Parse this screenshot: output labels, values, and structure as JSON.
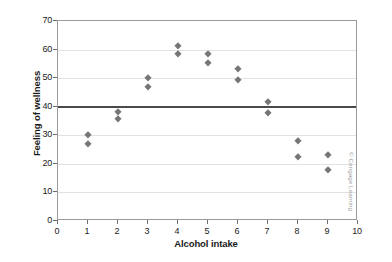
{
  "chart_data": {
    "type": "scatter",
    "title": "",
    "xlabel": "Alcohol intake",
    "ylabel": "Feeling of wellness",
    "xlim": [
      0,
      10
    ],
    "ylim": [
      0,
      70
    ],
    "xticks": [
      0,
      1,
      2,
      3,
      4,
      5,
      6,
      7,
      8,
      9,
      10
    ],
    "yticks": [
      0,
      10,
      20,
      30,
      40,
      50,
      60,
      70
    ],
    "grid": true,
    "legend": "none",
    "marker": "diamond",
    "marker_color": "#767676",
    "grid_color": "#e2e2e2",
    "frame_color": "#9a9a9a",
    "reference_line": {
      "orientation": "horizontal",
      "value": 40,
      "color": "#4a4a4a"
    },
    "x": [
      1,
      1,
      2,
      2,
      3,
      3,
      4,
      4,
      5,
      5,
      6,
      6,
      7,
      7,
      8,
      8,
      9,
      9
    ],
    "y": [
      30,
      27,
      38.3,
      35.7,
      50,
      47,
      61.3,
      58.3,
      58.3,
      55.3,
      53.2,
      49.2,
      41.5,
      37.7,
      28,
      22.3,
      23,
      18
    ],
    "points": [
      {
        "x": 1,
        "y": 30
      },
      {
        "x": 1,
        "y": 27
      },
      {
        "x": 2,
        "y": 38.3
      },
      {
        "x": 2,
        "y": 35.7
      },
      {
        "x": 3,
        "y": 50
      },
      {
        "x": 3,
        "y": 47
      },
      {
        "x": 4,
        "y": 61.3
      },
      {
        "x": 4,
        "y": 58.3
      },
      {
        "x": 5,
        "y": 58.3
      },
      {
        "x": 5,
        "y": 55.3
      },
      {
        "x": 6,
        "y": 53.2
      },
      {
        "x": 6,
        "y": 49.2
      },
      {
        "x": 7,
        "y": 41.5
      },
      {
        "x": 7,
        "y": 37.7
      },
      {
        "x": 8,
        "y": 28
      },
      {
        "x": 8,
        "y": 22.3
      },
      {
        "x": 9,
        "y": 23
      },
      {
        "x": 9,
        "y": 18
      }
    ]
  },
  "axes": {
    "x_title": "Alcohol intake",
    "y_title": "Feeling of wellness",
    "x_tick_labels": [
      "0",
      "1",
      "2",
      "3",
      "4",
      "5",
      "6",
      "7",
      "8",
      "9",
      "10"
    ],
    "y_tick_labels": [
      "0",
      "10",
      "20",
      "30",
      "40",
      "50",
      "60",
      "70"
    ]
  },
  "credit": {
    "text": "© Cengage Learning"
  }
}
